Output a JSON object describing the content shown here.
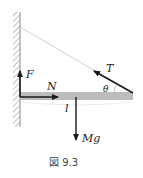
{
  "diagram": {
    "labels": {
      "F": "F",
      "N": "N",
      "T": "T",
      "theta": "θ",
      "l": "l",
      "Mg": "Mg"
    },
    "caption": "図 9.3",
    "colors": {
      "beam": "#b8b8b8",
      "arrow": "#1a1a1a",
      "rope": "#bdbdbd",
      "wall": "#888888"
    }
  }
}
